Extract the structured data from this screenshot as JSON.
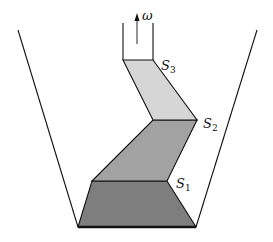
{
  "diagram": {
    "type": "layered-vessel",
    "colors": {
      "line": "#111111",
      "layer1": "#7e7e7e",
      "layer2": "#a2a2a2",
      "layer3": "#d6d6d6",
      "background": "#ffffff"
    },
    "arrow_label": "ω",
    "surfaces": [
      {
        "base": "S",
        "sub": "1"
      },
      {
        "base": "S",
        "sub": "2"
      },
      {
        "base": "S",
        "sub": "3"
      }
    ]
  }
}
